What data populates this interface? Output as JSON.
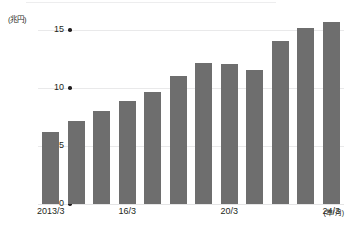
{
  "figure": {
    "y_unit_label": "(兆円)",
    "x_unit_label": "(年/月)",
    "bar_color": "#6e6e6e",
    "gridline_color": "#e9e9ea",
    "text_color": "#231f20",
    "background": "#ffffff"
  },
  "axis": {
    "y_ticks": [
      {
        "label": "15",
        "value": 15
      },
      {
        "label": "10",
        "value": 10
      },
      {
        "label": "5",
        "value": 5
      },
      {
        "label": "0",
        "value": 0
      }
    ],
    "x_ticks": [
      {
        "label": "2013/3",
        "index": 0
      },
      {
        "label": "16/3",
        "index": 3
      },
      {
        "label": "20/3",
        "index": 7
      },
      {
        "label": "24/3",
        "index": 11
      }
    ]
  },
  "chart_data": {
    "type": "bar",
    "title": "",
    "subtitle": "",
    "xlabel": "(年/月)",
    "ylabel": "(兆円)",
    "categories": [
      "2013/3",
      "14/3",
      "15/3",
      "16/3",
      "17/3",
      "18/3",
      "19/3",
      "20/3",
      "21/3",
      "22/3",
      "23/3",
      "24/3"
    ],
    "values": [
      6.2,
      7.2,
      8.0,
      8.9,
      9.7,
      11.0,
      12.2,
      12.1,
      11.6,
      14.1,
      15.2,
      15.7
    ],
    "series": [
      {
        "name": "",
        "values": [
          6.2,
          7.2,
          8.0,
          8.9,
          9.7,
          11.0,
          12.2,
          12.1,
          11.6,
          14.1,
          15.2,
          15.7
        ]
      }
    ],
    "ylim": [
      0,
      15.7
    ],
    "yticks": [
      0,
      5,
      10,
      15
    ],
    "grid": true,
    "legend": false,
    "legend_position": "none",
    "bar_color": "#6e6e6e"
  }
}
